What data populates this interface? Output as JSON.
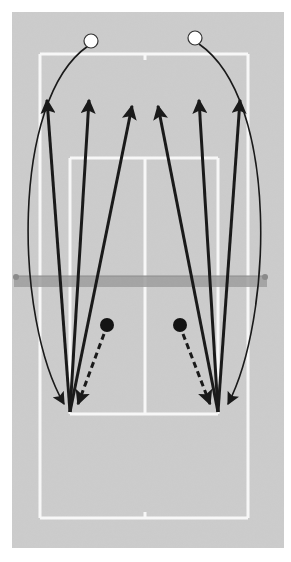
{
  "diagram": {
    "colors": {
      "page": "#ffffff",
      "court": "#cdcdcd",
      "court_noise": "#bdbdbd",
      "lines": "#f7f7f7",
      "net": "#9e9e9e",
      "net_post": "#8a8a8a",
      "arrow": "#1a1a1a",
      "player_far": "#ffffff",
      "player_near": "#141414"
    },
    "court": {
      "surface": {
        "x": 12,
        "y": 12,
        "w": 272,
        "h": 536
      },
      "doubles": {
        "left": 40,
        "right": 248,
        "top": 54,
        "bottom": 518
      },
      "singles": {
        "left": 70,
        "right": 218
      },
      "service_top": 158,
      "service_bottom": 414,
      "center_x": 145,
      "net": {
        "x1": 14,
        "x2": 267,
        "y": 276,
        "h": 11
      }
    },
    "players": {
      "far": [
        {
          "name": "far-left-player",
          "x": 91,
          "y": 41,
          "r": 7
        },
        {
          "name": "far-right-player",
          "x": 195,
          "y": 38,
          "r": 7
        }
      ],
      "near": [
        {
          "name": "near-left-player",
          "x": 107,
          "y": 325,
          "r": 7
        },
        {
          "name": "near-right-player",
          "x": 180,
          "y": 325,
          "r": 7
        }
      ]
    },
    "shots": {
      "left_origin": {
        "x": 70,
        "y": 412
      },
      "right_origin": {
        "x": 218,
        "y": 412
      },
      "straight": [
        {
          "from": "left",
          "to": {
            "x": 47,
            "y": 100
          }
        },
        {
          "from": "left",
          "to": {
            "x": 89,
            "y": 100
          }
        },
        {
          "from": "left",
          "to": {
            "x": 132,
            "y": 106
          }
        },
        {
          "from": "right",
          "to": {
            "x": 158,
            "y": 106
          }
        },
        {
          "from": "right",
          "to": {
            "x": 199,
            "y": 100
          }
        },
        {
          "from": "right",
          "to": {
            "x": 240,
            "y": 100
          }
        }
      ],
      "curved": [
        {
          "from": {
            "x": 88,
            "y": 46
          },
          "c1": {
            "x": 10,
            "y": 100
          },
          "c2": {
            "x": 15,
            "y": 320
          },
          "to": {
            "x": 64,
            "y": 404
          }
        },
        {
          "from": {
            "x": 199,
            "y": 44
          },
          "c1": {
            "x": 280,
            "y": 100
          },
          "c2": {
            "x": 272,
            "y": 320
          },
          "to": {
            "x": 228,
            "y": 404
          }
        }
      ],
      "dashed": [
        {
          "from": {
            "x": 104,
            "y": 334
          },
          "to": {
            "x": 78,
            "y": 404
          }
        },
        {
          "from": {
            "x": 183,
            "y": 334
          },
          "to": {
            "x": 210,
            "y": 404
          }
        }
      ]
    }
  }
}
